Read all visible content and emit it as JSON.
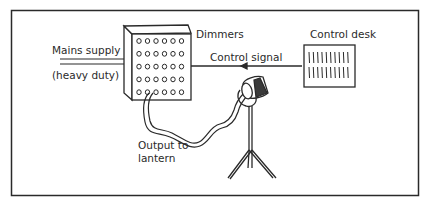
{
  "diagram": {
    "type": "lighting control system",
    "components": [
      {
        "id": "mains",
        "label_line1": "Mains supply",
        "label_line2": "(heavy duty)"
      },
      {
        "id": "dimmers",
        "label": "Dimmers",
        "grid": {
          "rows": 5,
          "cols": 6
        }
      },
      {
        "id": "control_desk",
        "label": "Control desk",
        "fader_rows": 2,
        "faders_per_row": 10
      },
      {
        "id": "lantern",
        "label_line1": "Output to",
        "label_line2": "lantern"
      }
    ],
    "connections": [
      {
        "from": "mains",
        "to": "dimmers",
        "label": "Mains supply (heavy duty)"
      },
      {
        "from": "control_desk",
        "to": "dimmers",
        "label": "Control signal",
        "arrow": "left"
      },
      {
        "from": "dimmers",
        "to": "lantern",
        "label": "Output to lantern"
      }
    ]
  },
  "labels": {
    "mains_1": "Mains supply",
    "mains_2": "(heavy duty)",
    "dimmers": "Dimmers",
    "control_signal": "Control signal",
    "control_desk": "Control desk",
    "output_1": "Output to",
    "output_2": "lantern"
  },
  "colors": {
    "stroke": "#2a2a2a",
    "background": "#ffffff"
  }
}
